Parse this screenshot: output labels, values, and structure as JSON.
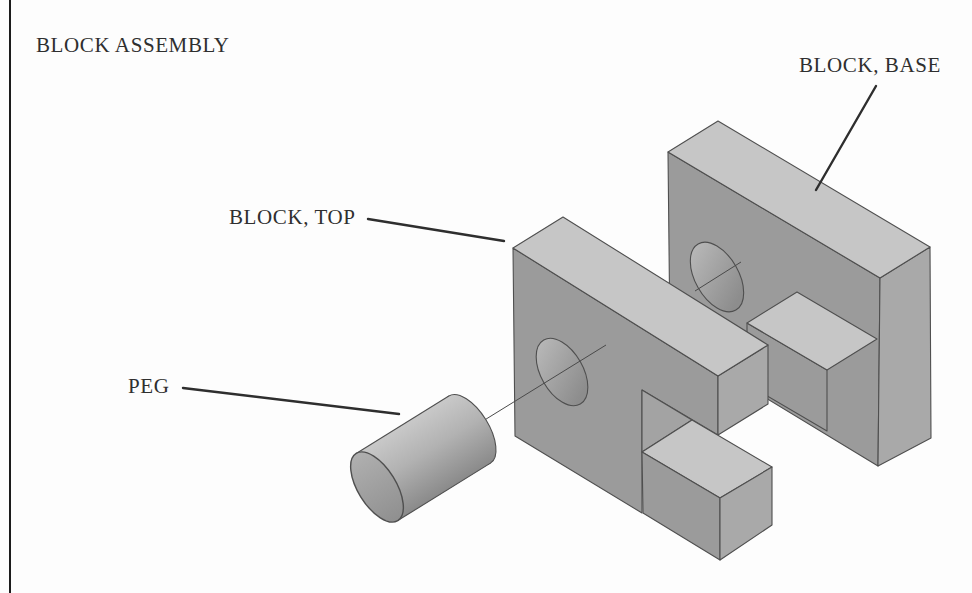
{
  "title": {
    "text": "BLOCK ASSEMBLY",
    "x": 36,
    "y": 33
  },
  "labels": [
    {
      "id": "block-base",
      "text": "BLOCK, BASE",
      "x": 799,
      "y": 53,
      "leader": [
        876,
        86,
        816,
        190
      ]
    },
    {
      "id": "block-top",
      "text": "BLOCK, TOP",
      "x": 229,
      "y": 205,
      "leader": [
        368,
        219,
        504,
        241
      ]
    },
    {
      "id": "peg",
      "text": "PEG",
      "x": 128,
      "y": 374,
      "leader": [
        183,
        388,
        399,
        414
      ]
    }
  ],
  "colors": {
    "background": "#fdfdfd",
    "frame": "#1c1c1c",
    "text": "#2f2f2f",
    "edge": "#4f4f4f",
    "leader": "#2e2e2e",
    "centerline": "#4a4a4a",
    "face_top": "#c6c6c6",
    "face_front": "#9b9b9b",
    "face_side": "#a9a9a9",
    "face_inner": "#a3a3a3",
    "hole_light": "#bdbdbd",
    "hole_dark": "#8d8d8d",
    "peg_light": "#c9c9c9",
    "peg_mid": "#b2b2b2",
    "peg_dark": "#8a8a8a",
    "peg_cap_light": "#b0b0b0",
    "peg_cap_dark": "#8f8f8f"
  },
  "diagram": {
    "parts": [
      {
        "id": "base-block",
        "faces": [
          {
            "id": "base-front-face",
            "fill": "face_front",
            "pts": "668,152 880,278 878,466 670,340"
          },
          {
            "id": "base-right-face",
            "fill": "face_side",
            "pts": "880,278 930,247 931,438 878,466"
          },
          {
            "id": "base-top-face",
            "fill": "face_top",
            "pts": "668,152 718,121 930,247 880,278"
          },
          {
            "id": "base-step-front-face",
            "fill": "face_front",
            "pts": "747,323 827,370 827,431 747,384"
          },
          {
            "id": "base-step-top-face",
            "fill": "face_top",
            "pts": "747,323 797,292 877,339 827,370"
          }
        ],
        "holes": [
          {
            "id": "base-hole",
            "cx": 717,
            "cy": 277,
            "rx": 21.7,
            "ry": 38.1,
            "rot": -29.7
          }
        ],
        "centerlines": [
          [
            695,
            291,
            741,
            262
          ]
        ]
      },
      {
        "id": "top-block",
        "faces": [
          {
            "id": "top-front-face",
            "fill": "face_front",
            "pts": "513,248 718,376 718,435 642,390 642,513 515,436"
          },
          {
            "id": "top-right-face",
            "fill": "face_side",
            "pts": "718,376 768,345 768,404 718,435"
          },
          {
            "id": "top-notch-face",
            "fill": "face_inner",
            "pts": "642,390 692,420 642,452"
          },
          {
            "id": "top-top-face",
            "fill": "face_top",
            "pts": "513,248 563,217 768,345 718,376"
          },
          {
            "id": "top-step-top-face",
            "fill": "face_top",
            "pts": "642,452 692,420 772,467 720,498"
          },
          {
            "id": "top-step-front-face",
            "fill": "face_front",
            "pts": "642,452 720,498 720,560 643,513"
          },
          {
            "id": "top-step-right-face",
            "fill": "face_side",
            "pts": "720,498 772,467 772,525 720,560"
          }
        ],
        "holes": [
          {
            "id": "top-hole",
            "cx": 562,
            "cy": 372,
            "rx": 21,
            "ry": 36.9,
            "rot": -29.7
          }
        ],
        "centerlines": [
          [
            470,
            429,
            606,
            345
          ]
        ]
      }
    ],
    "peg": {
      "cx": 377,
      "cy": 487,
      "angle": -31.8,
      "length": 109,
      "rx": 19,
      "ry": 39.5
    }
  }
}
